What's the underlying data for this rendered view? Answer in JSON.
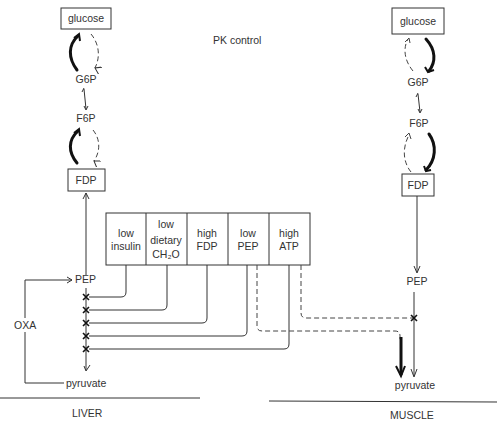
{
  "title": "PK control",
  "liver": {
    "label": "LIVER",
    "nodes": {
      "glucose": "glucose",
      "g6p": "G6P",
      "f6p": "F6P",
      "fdp": "FDP",
      "pep": "PEP",
      "pyruvate": "pyruvate",
      "oxa": "OXA"
    }
  },
  "muscle": {
    "label": "MUSCLE",
    "nodes": {
      "glucose": "glucose",
      "g6p": "G6P",
      "f6p": "F6P",
      "fdp": "FDP",
      "pep": "PEP",
      "pyruvate": "pyruvate"
    }
  },
  "controls": [
    {
      "line1": "low",
      "line2": "insulin",
      "line3": ""
    },
    {
      "line1": "low",
      "line2": "dietary",
      "line3": "CH₂O"
    },
    {
      "line1": "high",
      "line2": "FDP",
      "line3": ""
    },
    {
      "line1": "low",
      "line2": "PEP",
      "line3": ""
    },
    {
      "line1": "high",
      "line2": "ATP",
      "line3": ""
    }
  ],
  "inhibition_marker": "✕"
}
